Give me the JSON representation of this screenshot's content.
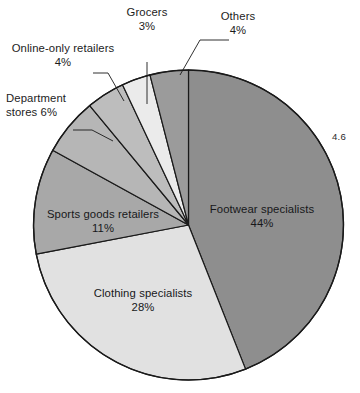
{
  "figure": {
    "corner_number": "4.6",
    "background_color": "#ffffff",
    "outline_color": "#1a1a1a"
  },
  "callouts": {
    "grocers": {
      "name": "Grocers",
      "value": "3%"
    },
    "others": {
      "name": "Others",
      "value": "4%"
    },
    "online_only": {
      "name": "Online-only retailers",
      "value": "4%"
    },
    "department_stores_line1": "Department",
    "department_stores_line2": "stores 6%"
  },
  "slice_labels": {
    "footwear": {
      "name": "Footwear specialists",
      "value": "44%"
    },
    "clothing": {
      "name": "Clothing specialists",
      "value": "28%"
    },
    "sports": {
      "name": "Sports goods retailers",
      "value": "11%"
    }
  },
  "chart_data": {
    "type": "pie",
    "title": "",
    "subtitle": "",
    "xlabel": "",
    "ylabel": "",
    "legend_position": "none",
    "grid": false,
    "start_angle_deg": 0,
    "direction": "clockwise",
    "units": "percent",
    "total": 100,
    "categories": [
      "Footwear specialists",
      "Clothing specialists",
      "Sports goods retailers",
      "Department stores",
      "Online-only retailers",
      "Grocers",
      "Others"
    ],
    "values": [
      44,
      28,
      11,
      6,
      4,
      3,
      4
    ],
    "labels": [
      "44%",
      "28%",
      "11%",
      "6%",
      "4%",
      "3%",
      "4%"
    ],
    "colors": [
      "#8e8e8e",
      "#e1e1e1",
      "#a8a8a8",
      "#b6b6b6",
      "#bdbdbd",
      "#ebebeb",
      "#9b9b9b"
    ],
    "label_placement": [
      "inside",
      "inside",
      "inside",
      "callout",
      "callout",
      "callout",
      "callout"
    ],
    "annotations": [
      "4.6"
    ],
    "series": [
      {
        "name": "Share of athletic footwear sales by retail channel",
        "values": [
          44,
          28,
          11,
          6,
          4,
          3,
          4
        ]
      }
    ]
  }
}
